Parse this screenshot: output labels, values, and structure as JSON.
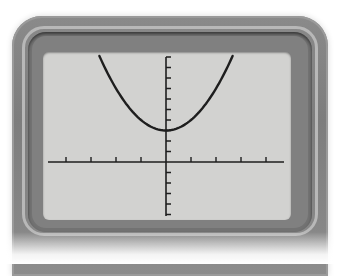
{
  "device": {
    "type": "graphing-calculator",
    "bezel_color": "#808080",
    "screen_color": "#d2d2d0",
    "ink_color": "#1e1e1e"
  },
  "graph": {
    "function": "y = x^2 + 3",
    "curve_type": "parabola",
    "vertex": [
      0,
      3
    ],
    "x_axis": {
      "ticks_negative": 4,
      "ticks_positive": 4,
      "tick_spacing": 1,
      "labels_shown": false
    },
    "y_axis": {
      "ticks_above": 10,
      "ticks_below": 5,
      "tick_spacing": 1,
      "labels_shown": false
    },
    "window": {
      "xmin": -4.7,
      "xmax": 4.7,
      "ymin": -5.2,
      "ymax": 10.5
    }
  }
}
